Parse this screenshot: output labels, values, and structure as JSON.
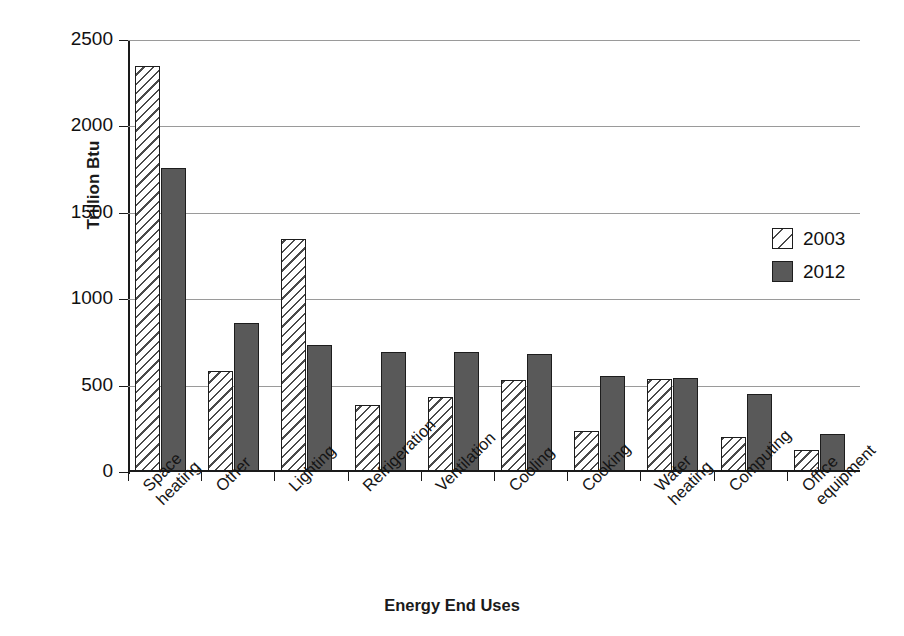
{
  "chart_data": {
    "type": "bar",
    "title": "",
    "xlabel": "Energy End Uses",
    "ylabel": "Trillion Btu",
    "ylim": [
      0,
      2500
    ],
    "yticks": [
      0,
      500,
      1000,
      1500,
      2000,
      2500
    ],
    "ytick_labels": [
      "0",
      "500",
      "1000",
      "1500",
      "2000",
      "2500"
    ],
    "grid": true,
    "legend_position": "right-middle",
    "categories": [
      "Space\nheating",
      "Other",
      "Lighting",
      "Refrigeration",
      "Ventilation",
      "Cooling",
      "Cooking",
      "Water\nheating",
      "Computing",
      "Office\nequipment"
    ],
    "series": [
      {
        "name": "2003",
        "values": [
          2350,
          585,
          1350,
          385,
          435,
          535,
          240,
          540,
          200,
          130
        ]
      },
      {
        "name": "2012",
        "values": [
          1760,
          865,
          735,
          695,
          695,
          685,
          555,
          545,
          450,
          220
        ]
      }
    ]
  },
  "legend": {
    "items": [
      {
        "label": "2003",
        "swatch": "hatched-diagonal"
      },
      {
        "label": "2012",
        "swatch": "solid-gray"
      }
    ]
  },
  "colors": {
    "series_2003_fill": "#ffffff",
    "series_2003_hatch": "#4a4a4a",
    "series_2012_fill": "#595959",
    "axis": "#1a1a1a",
    "gridline": "#9a9a9a",
    "background": "#ffffff"
  }
}
